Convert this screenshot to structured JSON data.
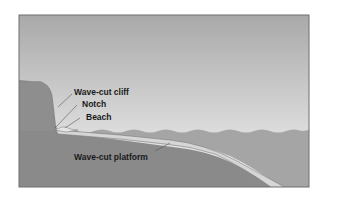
{
  "diagram": {
    "labels": {
      "cliff": "Wave-cut cliff",
      "notch": "Notch",
      "beach": "Beach",
      "platform": "Wave-cut platform"
    },
    "colors": {
      "sky_top": "#a9a9a9",
      "sky_bottom": "#f2f2f2",
      "cliff": "#8c8c8c",
      "sea": "#a4a4a4",
      "platform": "#d4d4d4",
      "bedrock": "#888888",
      "frame": "#6e6e6e"
    }
  }
}
